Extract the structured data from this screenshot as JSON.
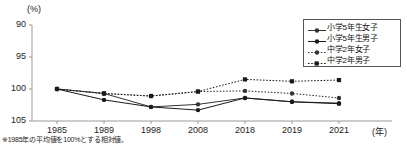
{
  "chart_data": {
    "type": "line",
    "title": "",
    "subtitle": "",
    "xlabel": "(年)",
    "ylabel": "(%)",
    "categories": [
      "1985",
      "1989",
      "1998",
      "2008",
      "2018",
      "2019",
      "2021"
    ],
    "x_tick_labels": [
      "1985",
      "1989",
      "1998",
      "2008",
      "2018",
      "2019",
      "2021"
    ],
    "y_tick_labels": [
      "90",
      "95",
      "100",
      "105"
    ],
    "y_tick_values": [
      90,
      95,
      100,
      105
    ],
    "ylim": [
      90,
      105
    ],
    "y_axis_inverted": true,
    "grid": false,
    "legend_position": "top-right",
    "annotation": "※1985年の平均値を100%とする相対値。",
    "series": [
      {
        "name": "小学5年生女子",
        "line_style": "solid",
        "marker": "circle",
        "color": "#333333",
        "values": [
          100.0,
          100.7,
          102.8,
          102.4,
          101.4,
          102.0,
          102.2
        ]
      },
      {
        "name": "小学5年生男子",
        "line_style": "solid",
        "marker": "circle",
        "color": "#1a1a1a",
        "values": [
          100.0,
          101.7,
          102.8,
          103.3,
          101.4,
          102.0,
          102.3
        ]
      },
      {
        "name": "中学2年女子",
        "line_style": "dotted",
        "marker": "circle",
        "color": "#333333",
        "values": [
          100.0,
          100.7,
          101.1,
          100.4,
          100.3,
          100.7,
          101.4
        ]
      },
      {
        "name": "中学2年男子",
        "line_style": "dotted",
        "marker": "square",
        "color": "#1a1a1a",
        "values": [
          100.0,
          100.7,
          101.1,
          100.4,
          98.5,
          98.8,
          98.6
        ]
      }
    ]
  },
  "axis": {
    "y_unit": "(%)",
    "x_unit": "(年)"
  },
  "legend": {
    "items": [
      {
        "label": "小学5年生女子"
      },
      {
        "label": "小学5年生男子"
      },
      {
        "label": "中学2年女子"
      },
      {
        "label": "中学2年男子"
      }
    ]
  },
  "footnote": {
    "text": "※1985年の平均値を100%とする相対値。"
  }
}
